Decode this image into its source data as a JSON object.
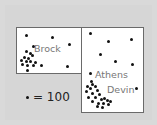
{
  "map": {
    "regions": [
      {
        "id": "left",
        "label": "Brock"
      },
      {
        "id": "right",
        "labels": [
          "Athens",
          "Devin"
        ]
      }
    ],
    "labels": [
      {
        "text": "Brock",
        "x": 34,
        "y": 50
      },
      {
        "text": "Athens",
        "x": 95,
        "y": 75
      },
      {
        "text": "Devin",
        "x": 107,
        "y": 90
      }
    ],
    "dots": [
      [
        26,
        35
      ],
      [
        52,
        37
      ],
      [
        69,
        44
      ],
      [
        33,
        46
      ],
      [
        26,
        51
      ],
      [
        30,
        53
      ],
      [
        24,
        57
      ],
      [
        28,
        58
      ],
      [
        32,
        55
      ],
      [
        21,
        60
      ],
      [
        26,
        61
      ],
      [
        30,
        61
      ],
      [
        35,
        62
      ],
      [
        22,
        64
      ],
      [
        27,
        65
      ],
      [
        33,
        65
      ],
      [
        41,
        65
      ],
      [
        27,
        70
      ],
      [
        67,
        66
      ],
      [
        90,
        33
      ],
      [
        108,
        41
      ],
      [
        131,
        39
      ],
      [
        100,
        54
      ],
      [
        115,
        61
      ],
      [
        132,
        64
      ],
      [
        90,
        73
      ],
      [
        91,
        81
      ],
      [
        87,
        86
      ],
      [
        92,
        84
      ],
      [
        95,
        86
      ],
      [
        90,
        88
      ],
      [
        97,
        90
      ],
      [
        86,
        91
      ],
      [
        92,
        93
      ],
      [
        99,
        94
      ],
      [
        88,
        97
      ],
      [
        95,
        97
      ],
      [
        101,
        99
      ],
      [
        104,
        98
      ],
      [
        107,
        100
      ],
      [
        110,
        101
      ],
      [
        92,
        101
      ],
      [
        98,
        103
      ],
      [
        103,
        103
      ],
      [
        108,
        104
      ],
      [
        97,
        106
      ],
      [
        102,
        107
      ],
      [
        136,
        88
      ]
    ]
  },
  "legend": {
    "symbol": "dot",
    "equals": "= 100"
  }
}
